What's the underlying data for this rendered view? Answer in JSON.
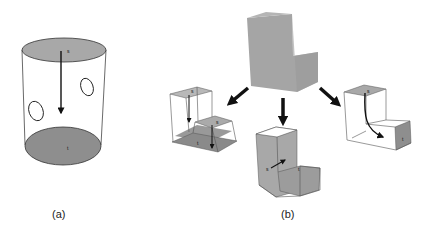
{
  "figure": {
    "panels": [
      {
        "id": "a",
        "caption": "(a)",
        "shape": "cylinder",
        "source_label": "s",
        "target_label": "t",
        "holes": 2
      },
      {
        "id": "b",
        "caption": "(b)",
        "shape": "L-shaped block",
        "decompositions": [
          {
            "name": "left-split",
            "labels": [
              "s",
              "s",
              "t"
            ]
          },
          {
            "name": "middle-split",
            "labels": [
              "s",
              "t"
            ]
          },
          {
            "name": "right-sweep",
            "labels": [
              "s",
              "t"
            ]
          }
        ]
      }
    ],
    "colors": {
      "face_fill_light": "#b8b8b8",
      "face_fill_dark": "#8c8c8c",
      "solid_fill": "#a8a8a8",
      "edge": "#555555",
      "arrow": "#111111"
    }
  }
}
